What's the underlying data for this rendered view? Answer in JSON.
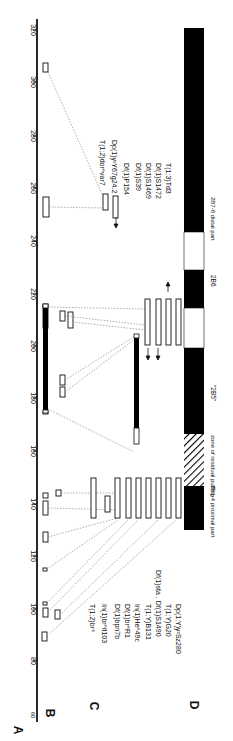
{
  "figure": {
    "panel_labels": {
      "A": "A",
      "B": "B",
      "C": "C",
      "D": "D"
    },
    "axis": {
      "ticks": [
        60,
        80,
        100,
        120,
        140,
        160,
        180,
        200,
        220,
        240,
        260,
        280,
        300,
        320
      ],
      "tick_labels": [
        "60",
        "80",
        "100",
        "120",
        "140",
        "160",
        "180",
        "200",
        "220",
        "240",
        "260",
        "280",
        "300",
        "320"
      ]
    },
    "rearrangements_lower": [
      "T(1;2)br⁴",
      "In(1)br^lt103",
      "Df(1)bpn7b",
      "Df(1)br^R1",
      "In(1)He^49c",
      "T(1;Y)B131",
      "Df(1)sta , Df(1)S1490",
      "T(1;Y)G20",
      "Dp(1;Y)y²Sz280"
    ],
    "rearrangements_upper": [
      "T(1;2)dor^var7",
      "Dp(1)y²Y67g24.2",
      "Df(1)P154",
      "Df(1)S39",
      "Df(1)S1469",
      "Df(1)S1472",
      "T(1;3)Td3"
    ],
    "chromosome_labels": {
      "proximal": "2B3-4 proximal part",
      "residual": "zone of residual puffing",
      "b5": "\"2B5\"",
      "b6": "2B6",
      "distal": "2B7-8 distal part"
    },
    "colors": {
      "ink": "#111111",
      "band": "#000000",
      "paper": "#ffffff",
      "dotted": "#888888"
    }
  }
}
